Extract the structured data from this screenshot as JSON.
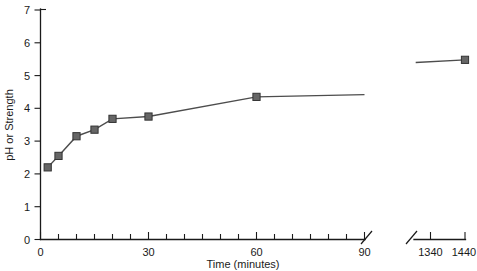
{
  "chart_data": {
    "type": "line",
    "title": "",
    "xlabel": "Time (minutes)",
    "ylabel": "pH or Strength",
    "ylim": [
      0,
      7
    ],
    "y_ticks": [
      0,
      1,
      2,
      3,
      4,
      5,
      6,
      7
    ],
    "x_axis": {
      "broken": true,
      "segments": [
        {
          "range": [
            0,
            90
          ],
          "labeled_ticks": [
            0,
            30,
            60,
            90
          ],
          "minor_tick_step": 5
        },
        {
          "range": [
            1290,
            1440
          ],
          "labeled_ticks": [
            1340,
            1440
          ],
          "minor_tick_step": 50
        }
      ],
      "break_symbol": "double-slash"
    },
    "grid": false,
    "legend": null,
    "series": [
      {
        "name": "pH or Strength",
        "marker": "square",
        "marker_color": "#666666",
        "line_color": "#4d4d4d",
        "points": [
          {
            "x": 2,
            "y": 2.2,
            "marker": true
          },
          {
            "x": 5,
            "y": 2.55,
            "marker": true
          },
          {
            "x": 10,
            "y": 3.15,
            "marker": true
          },
          {
            "x": 15,
            "y": 3.35,
            "marker": true
          },
          {
            "x": 20,
            "y": 3.68,
            "marker": true
          },
          {
            "x": 30,
            "y": 3.75,
            "marker": true
          },
          {
            "x": 60,
            "y": 4.35,
            "marker": true
          },
          {
            "x": 90,
            "y": 4.42,
            "marker": false
          }
        ]
      },
      {
        "name": "pH or Strength (after break)",
        "marker": "square",
        "marker_color": "#666666",
        "line_color": "#4d4d4d",
        "points": [
          {
            "x": 1295,
            "y": 5.4,
            "marker": false
          },
          {
            "x": 1440,
            "y": 5.48,
            "marker": true
          }
        ]
      }
    ]
  },
  "labels": {
    "y_axis_title": "pH or Strength",
    "x_axis_title": "Time (minutes)",
    "y_ticks": [
      "0",
      "1",
      "2",
      "3",
      "4",
      "5",
      "6",
      "7"
    ],
    "x_ticks_left": [
      "0",
      "30",
      "60",
      "90"
    ],
    "x_ticks_right": [
      "1340",
      "1440"
    ]
  }
}
